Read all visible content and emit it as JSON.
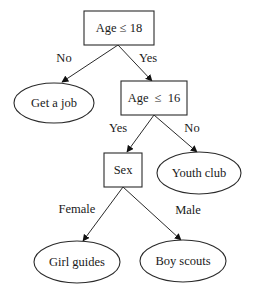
{
  "diagram": {
    "type": "decision-tree",
    "nodes": {
      "root": {
        "shape": "rect",
        "label": "Age ≤ 18"
      },
      "get_job": {
        "shape": "ellipse",
        "label": "Get a job"
      },
      "age16": {
        "shape": "rect",
        "label": "Age  ≤  16"
      },
      "sex": {
        "shape": "rect",
        "label": "Sex"
      },
      "youth_club": {
        "shape": "ellipse",
        "label": "Youth club"
      },
      "girl_guides": {
        "shape": "ellipse",
        "label": "Girl guides"
      },
      "boy_scouts": {
        "shape": "ellipse",
        "label": "Boy scouts"
      }
    },
    "edges": {
      "root_to_job": {
        "from": "root",
        "to": "get_job",
        "label": "No"
      },
      "root_to_age16": {
        "from": "root",
        "to": "age16",
        "label": "Yes"
      },
      "age16_to_sex": {
        "from": "age16",
        "to": "sex",
        "label": "Yes"
      },
      "age16_to_youth": {
        "from": "age16",
        "to": "youth_club",
        "label": "No"
      },
      "sex_to_girl": {
        "from": "sex",
        "to": "girl_guides",
        "label": "Female"
      },
      "sex_to_boy": {
        "from": "sex",
        "to": "boy_scouts",
        "label": "Male"
      }
    },
    "colors": {
      "stroke": "#2a2a2a",
      "text": "#1a1a1a",
      "background": "#ffffff"
    }
  }
}
